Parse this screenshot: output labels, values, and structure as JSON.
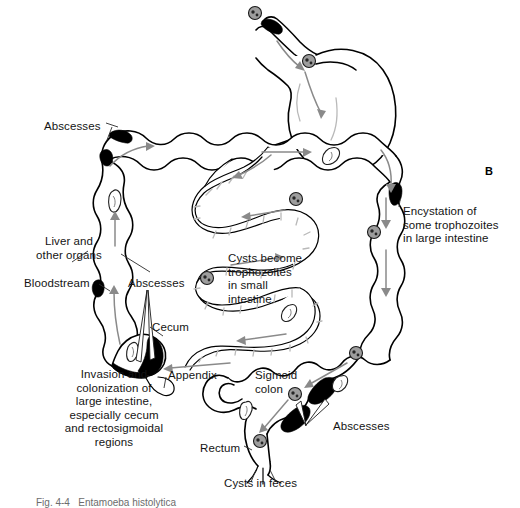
{
  "figure": {
    "panel_letter": "B",
    "caption": "Fig. 4-4   Entamoeba histolytica"
  },
  "labels": [
    {
      "id": "abscesses-hepatic-flexure",
      "text": "Abscesses",
      "x": 44,
      "y": 120,
      "align": "left",
      "target": "hepatic-flexure"
    },
    {
      "id": "liver-and-other-organs",
      "text": "Liver and\nother organs",
      "x": 17,
      "y": 235,
      "align": "left",
      "target": "ascending-colon-wall"
    },
    {
      "id": "bloodstream",
      "text": "Bloodstream",
      "x": 24,
      "y": 277,
      "align": "left",
      "target": "ascending-colon-wall"
    },
    {
      "id": "abscesses-ascending",
      "text": "Abscesses",
      "x": 128,
      "y": 277,
      "align": "left",
      "target": "ascending-colon"
    },
    {
      "id": "cecum",
      "text": "Cecum",
      "x": 152,
      "y": 321,
      "align": "left",
      "target": "cecum-shape"
    },
    {
      "id": "appendix",
      "text": "Appendix",
      "x": 168,
      "y": 369,
      "align": "left",
      "target": "appendix-shape"
    },
    {
      "id": "invasion-colonization",
      "text": "Invasion and\ncolonization of\nlarge intestine,\nespecially cecum\nand rectosigmoidal\nregions",
      "x": 64,
      "y": 368,
      "align": "center",
      "target": "cecum-shape"
    },
    {
      "id": "cysts-become-trophozoites",
      "text": "Cysts become\ntrophozoites\nin small\nintestine",
      "x": 228,
      "y": 252,
      "align": "left",
      "target": "small-intestine"
    },
    {
      "id": "encystation",
      "text": "Encystation of\nsome trophozoites\nin large intestine",
      "x": 403,
      "y": 205,
      "align": "left",
      "target": "descending-colon"
    },
    {
      "id": "sigmoid-colon",
      "text": "Sigmoid\ncolon",
      "x": 255,
      "y": 369,
      "align": "left",
      "target": "sigmoid-shape"
    },
    {
      "id": "abscesses-sigmoid",
      "text": "Abscesses",
      "x": 310,
      "y": 420,
      "align": "left",
      "target": "sigmoid-shape"
    },
    {
      "id": "rectum",
      "text": "Rectum",
      "x": 200,
      "y": 442,
      "align": "left",
      "target": "rectum-shape"
    },
    {
      "id": "cysts-in-feces",
      "text": "Cysts in feces",
      "x": 224,
      "y": 477,
      "align": "left",
      "target": "anus-shape"
    }
  ],
  "organs": [
    {
      "id": "stomach",
      "name": "stomach"
    },
    {
      "id": "esophagus",
      "name": "esophagus"
    },
    {
      "id": "transverse-colon",
      "name": "transverse-colon"
    },
    {
      "id": "ascending-colon",
      "name": "ascending-colon"
    },
    {
      "id": "descending-colon",
      "name": "descending-colon"
    },
    {
      "id": "small-intestine",
      "name": "small-intestine"
    },
    {
      "id": "cecum",
      "name": "cecum"
    },
    {
      "id": "appendix",
      "name": "appendix"
    },
    {
      "id": "sigmoid-colon",
      "name": "sigmoid-colon"
    },
    {
      "id": "rectum",
      "name": "rectum"
    }
  ],
  "colors": {
    "background": "#ffffff",
    "outline": "#000000",
    "abscess": "#000000",
    "flow_arrow": "#8a8a8a",
    "cyst": "#9d9d9d",
    "text": "#141414",
    "caption": "#6c6c6c"
  }
}
